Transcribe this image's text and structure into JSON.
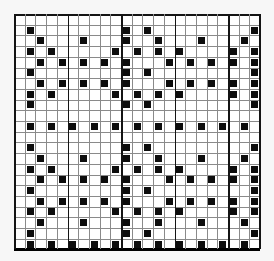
{
  "chart": {
    "type": "stitch-pattern-grid",
    "title": "",
    "columns": 23,
    "rows": 22,
    "bold_vertical_line_interval": 5,
    "colors": {
      "page_background": "#f7f7f7",
      "cell_fill": "#ffffff",
      "gridline": "#8a8a8a",
      "bold_gridline": "#141414",
      "filled_square": "#0d0d0d",
      "bottom_border": "#000000"
    },
    "motifs": {
      "empty": [],
      "A": [
        2,
        11,
        13,
        23
      ],
      "B": [
        3,
        7,
        11,
        14,
        18,
        22
      ],
      "C": [
        2,
        4,
        10,
        12,
        14,
        16,
        21,
        23
      ],
      "D": [
        3,
        5,
        7,
        9,
        11,
        15,
        17,
        19,
        21,
        23
      ],
      "E": [
        2,
        4,
        6,
        8,
        10,
        12,
        14,
        16,
        18,
        20,
        22
      ]
    },
    "row_sequence": [
      "empty",
      "A",
      "B",
      "C",
      "D",
      "A",
      "D",
      "C",
      "A",
      "empty",
      "E",
      "empty",
      "A",
      "B",
      "C",
      "D",
      "A",
      "D",
      "C",
      "B",
      "A",
      "E"
    ]
  }
}
